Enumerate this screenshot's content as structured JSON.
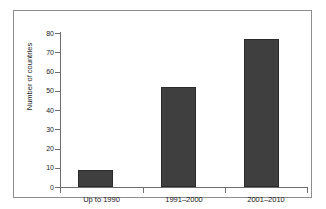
{
  "chart_data": {
    "type": "bar",
    "title": "",
    "xlabel": "",
    "ylabel": "Number of countries",
    "categories": [
      "Up to 1990",
      "1991–2000",
      "2001–2010"
    ],
    "values": [
      9,
      52,
      77
    ],
    "ylim": [
      0,
      80
    ],
    "ytick_step": 10,
    "yticks": [
      0,
      10,
      20,
      30,
      40,
      50,
      60,
      70,
      80
    ],
    "ytick_labels": [
      "0",
      "10",
      "20",
      "30",
      "40",
      "50",
      "60",
      "70",
      "80"
    ],
    "grid": false,
    "legend": null,
    "legend_position": "none",
    "bar_color": "#3f3f3f",
    "bar_edge_color": "#2b2b2b",
    "axis_color": "#6f6f6f",
    "frame_color": "#8d8d8d",
    "background_color": "#ffffff",
    "annotations": []
  },
  "axis": {
    "y_title": "Number of countries",
    "tick_0": "0",
    "tick_10": "10",
    "tick_20": "20",
    "tick_30": "30",
    "tick_40": "40",
    "tick_50": "50",
    "tick_60": "60",
    "tick_70": "70",
    "tick_80": "80"
  },
  "series": {
    "cat_0": "Up to 1990",
    "cat_1": "1991–2000",
    "cat_2": "2001–2010"
  }
}
